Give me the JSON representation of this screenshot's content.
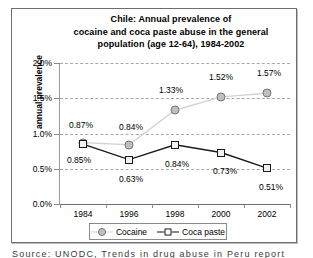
{
  "chart_data": {
    "type": "line",
    "title": "Chile: Annual prevalence of cocaine  and coca paste abuse in the general population (age 12-64), 1984-2002",
    "title_lines": [
      "Chile: Annual prevalence of",
      "cocaine  and coca paste abuse in the general",
      "population (age 12-64), 1984-2002"
    ],
    "xlabel": "",
    "ylabel": "annual prevalence",
    "categories": [
      "1984",
      "1996",
      "1998",
      "2000",
      "2002"
    ],
    "ylim": [
      0,
      2.0
    ],
    "ytick_labels": [
      "0.0%",
      "0.5%",
      "1.0%",
      "1.5%",
      "2.0%"
    ],
    "ytick_values": [
      0,
      0.5,
      1.0,
      1.5,
      2.0
    ],
    "grid": true,
    "grid_style": "dashed-horizontal",
    "legend_position": "bottom",
    "series": [
      {
        "name": "Cocaine",
        "marker": "circle",
        "color": "#bfbfbf",
        "line_color": "#d4d4d4",
        "values": [
          0.87,
          0.84,
          1.33,
          1.52,
          1.57
        ],
        "labels": [
          "0.87%",
          "0.84%",
          "1.33%",
          "1.52%",
          "1.57%"
        ]
      },
      {
        "name": "Coca paste",
        "marker": "square",
        "color": "#f2f2f2",
        "line_color": "#1a1a1a",
        "values": [
          0.85,
          0.63,
          0.84,
          0.73,
          0.51
        ],
        "labels": [
          "0.85%",
          "0.63%",
          "0.84%",
          "0.73%",
          "0.51%"
        ]
      }
    ]
  },
  "legend": {
    "entries": [
      {
        "label": "Cocaine"
      },
      {
        "label": "Coca paste"
      }
    ]
  },
  "footer": {
    "clipped_text": "Source:  UNODC,  Trends in drug abuse in Peru  report"
  }
}
